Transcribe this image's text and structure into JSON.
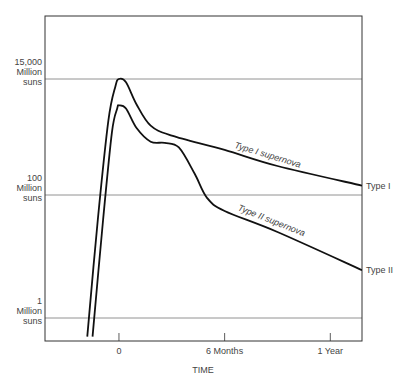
{
  "chart_data": {
    "type": "line",
    "title": "",
    "xlabel": "TIME",
    "ylabel": "",
    "x_unit": "months",
    "xlim": [
      -4.2,
      13.8
    ],
    "y_scale": "log",
    "y_unit": "million suns",
    "x_ticks": [
      {
        "value": 0,
        "label": "0"
      },
      {
        "value": 6,
        "label": "6 Months"
      },
      {
        "value": 12,
        "label": "1 Year"
      }
    ],
    "y_ticks": [
      {
        "value": 15000,
        "lines": [
          "15,000",
          "Million",
          "suns"
        ]
      },
      {
        "value": 100,
        "lines": [
          "100",
          "Million",
          "suns"
        ]
      },
      {
        "value": 1,
        "lines": [
          "1",
          "Million",
          "suns"
        ]
      }
    ],
    "grid": "horizontal at y ticks",
    "series": [
      {
        "name": "Type I supernova",
        "end_label": "Type I",
        "curve_label": "Type I supernova",
        "points": [
          [
            -1.8,
            0.5
          ],
          [
            -1.2,
            40
          ],
          [
            -0.6,
            2500
          ],
          [
            -0.2,
            11000
          ],
          [
            0,
            15000
          ],
          [
            0.4,
            13000
          ],
          [
            1,
            5000
          ],
          [
            1.8,
            2000
          ],
          [
            3,
            1300
          ],
          [
            6,
            700
          ],
          [
            9,
            350
          ],
          [
            13.8,
            150
          ]
        ]
      },
      {
        "name": "Type II supernova",
        "end_label": "Type II",
        "curve_label": "Type II supernova",
        "points": [
          [
            -1.5,
            0.5
          ],
          [
            -0.9,
            40
          ],
          [
            -0.4,
            1500
          ],
          [
            -0.1,
            4200
          ],
          [
            0,
            4800
          ],
          [
            0.4,
            4200
          ],
          [
            1,
            1800
          ],
          [
            1.8,
            1000
          ],
          [
            2.6,
            950
          ],
          [
            3.4,
            780
          ],
          [
            4.3,
            250
          ],
          [
            5,
            90
          ],
          [
            6,
            55
          ],
          [
            9,
            25
          ],
          [
            13.8,
            6
          ]
        ]
      }
    ]
  }
}
